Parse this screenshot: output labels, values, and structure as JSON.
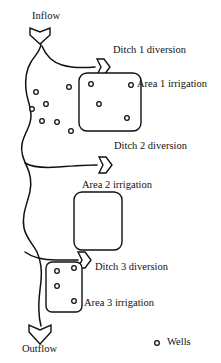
{
  "figure": {
    "type": "schematic-diagram",
    "canvas": {
      "width": 221,
      "height": 363
    },
    "background_color": "#ffffff",
    "line_color": "#111111"
  },
  "labels": {
    "inflow": "Inflow",
    "outflow": "Outflow",
    "ditch1": "Ditch 1 diversion",
    "ditch2": "Ditch 2 diversion",
    "ditch3": "Ditch 3 diversion",
    "area1": "Area 1 irrigation",
    "area2": "Area 2 irrigation",
    "area3": "Area 3 irrigation"
  },
  "legend": {
    "well_label": "Wells",
    "marker": "small-open-circle"
  },
  "flow_arrows": [
    {
      "name": "inflow-arrow",
      "direction": "down",
      "x": 40,
      "y": 32
    },
    {
      "name": "ditch-1-diversion-arrow",
      "direction": "right",
      "x": 100,
      "y": 62
    },
    {
      "name": "ditch-2-diversion-arrow",
      "direction": "right",
      "x": 102,
      "y": 160
    },
    {
      "name": "ditch-3-diversion-arrow",
      "direction": "right",
      "x": 81,
      "y": 256
    },
    {
      "name": "outflow-arrow",
      "direction": "down",
      "x": 40,
      "y": 330
    }
  ],
  "areas": [
    {
      "name": "area-1-box",
      "x": 79,
      "y": 73,
      "width": 62,
      "height": 58,
      "wells_inside": 3
    },
    {
      "name": "area-2-box",
      "x": 74,
      "y": 192,
      "width": 48,
      "height": 58,
      "wells_inside": 0
    },
    {
      "name": "area-3-box",
      "x": 46,
      "y": 262,
      "width": 36,
      "height": 50,
      "wells_inside": 4
    }
  ],
  "wells": {
    "marker_style": "open circle with dark outline",
    "count_total": 16,
    "points": [
      {
        "x": 36,
        "y": 92
      },
      {
        "x": 69,
        "y": 87
      },
      {
        "x": 32,
        "y": 109
      },
      {
        "x": 46,
        "y": 104
      },
      {
        "x": 42,
        "y": 121
      },
      {
        "x": 57,
        "y": 122
      },
      {
        "x": 71,
        "y": 131
      },
      {
        "x": 91,
        "y": 84
      },
      {
        "x": 131,
        "y": 85
      },
      {
        "x": 99,
        "y": 104
      },
      {
        "x": 127,
        "y": 118
      },
      {
        "x": 57,
        "y": 271
      },
      {
        "x": 74,
        "y": 268
      },
      {
        "x": 57,
        "y": 286
      },
      {
        "x": 74,
        "y": 301
      },
      {
        "x": 157,
        "y": 343
      }
    ]
  }
}
